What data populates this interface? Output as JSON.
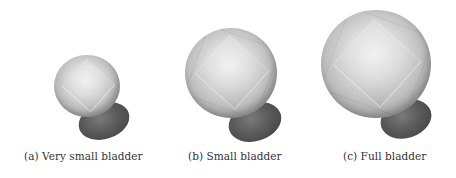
{
  "figure": {
    "panels": [
      {
        "label": "(a) Very small bladder"
      },
      {
        "label": "(b) Small bladder"
      },
      {
        "label": "(c) Full bladder"
      }
    ]
  }
}
